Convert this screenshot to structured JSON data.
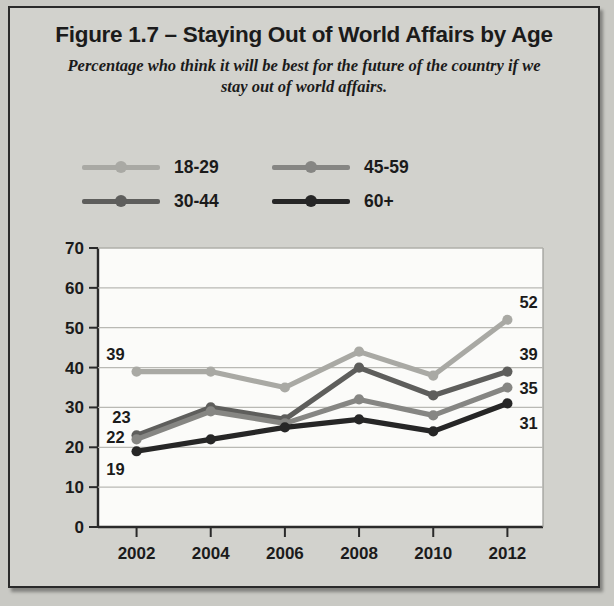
{
  "figure": {
    "title": "Figure 1.7 – Staying Out of World Affairs by Age",
    "subtitle": "Percentage who think it will be best for the future of the country if we stay out of world affairs."
  },
  "legend": {
    "position": "above-plot",
    "items": [
      {
        "label": "18-29",
        "color": "#a9a9a4"
      },
      {
        "label": "45-59",
        "color": "#868683"
      },
      {
        "label": "30-44",
        "color": "#5e5e5c"
      },
      {
        "label": "60+",
        "color": "#262626"
      }
    ]
  },
  "axes": {
    "y_ticks": [
      "70",
      "60",
      "50",
      "40",
      "30",
      "20",
      "10",
      "0"
    ],
    "x_ticks": [
      "2002",
      "2004",
      "2006",
      "2008",
      "2010",
      "2012"
    ]
  },
  "chart_data": {
    "type": "line",
    "title": "Figure 1.7 – Staying Out of World Affairs by Age",
    "subtitle": "Percentage who think it will be best for the future of the country if we stay out of world affairs.",
    "xlabel": "",
    "ylabel": "",
    "x": [
      2002,
      2004,
      2006,
      2008,
      2010,
      2012
    ],
    "categories": [
      "2002",
      "2004",
      "2006",
      "2008",
      "2010",
      "2012"
    ],
    "ylim": [
      0,
      70
    ],
    "ytick_step": 10,
    "grid": true,
    "legend_position": "top",
    "series": [
      {
        "name": "18-29",
        "color": "#a9a9a4",
        "values": [
          39,
          39,
          35,
          44,
          38,
          52
        ],
        "point_labels": [
          {
            "index": 0,
            "text": "39",
            "side": "left"
          },
          {
            "index": 5,
            "text": "52",
            "side": "right"
          }
        ]
      },
      {
        "name": "30-44",
        "color": "#5e5e5c",
        "values": [
          23,
          30,
          27,
          40,
          33,
          39
        ],
        "point_labels": [
          {
            "index": 0,
            "text": "23",
            "side": "left"
          },
          {
            "index": 5,
            "text": "39",
            "side": "right"
          }
        ]
      },
      {
        "name": "45-59",
        "color": "#868683",
        "values": [
          22,
          29,
          26,
          32,
          28,
          35
        ],
        "point_labels": [
          {
            "index": 0,
            "text": "22",
            "side": "left"
          },
          {
            "index": 5,
            "text": "35",
            "side": "right"
          }
        ]
      },
      {
        "name": "60+",
        "color": "#262626",
        "values": [
          19,
          22,
          25,
          27,
          24,
          31
        ],
        "point_labels": [
          {
            "index": 0,
            "text": "19",
            "side": "left"
          },
          {
            "index": 5,
            "text": "31",
            "side": "right"
          }
        ]
      }
    ]
  }
}
